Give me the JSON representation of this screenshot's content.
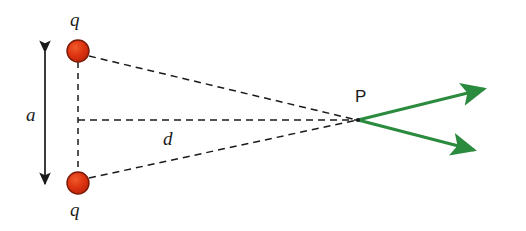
{
  "figure": {
    "background_color": "#ffffff"
  },
  "colors": {
    "charge_fill": "#dd3311",
    "charge_stroke": "#7a1a08",
    "field_arrow": "#2a8a3e",
    "construction_line": "#1a1a1a",
    "dimension_arrow": "#1a1a1a",
    "label_text": "#1a1a1a"
  },
  "labels": {
    "charge_top": "q",
    "charge_bottom": "q",
    "separation": "a",
    "distance": "d",
    "point": "P"
  },
  "charges": [
    {
      "name": "charge-top",
      "label": "q",
      "x": 78,
      "y": 51,
      "radius": 11
    },
    {
      "name": "charge-bottom",
      "label": "q",
      "x": 78,
      "y": 183,
      "radius": 11
    }
  ],
  "point_p": {
    "label": "P",
    "x": 358,
    "y": 120
  },
  "dimension_arrow": {
    "name": "separation-arrow",
    "label": "a",
    "x": 45,
    "y_top": 46,
    "y_bottom": 190,
    "double_headed": true
  },
  "construction_lines": [
    {
      "name": "vertical-axis-line",
      "x1": 78,
      "y1": 51,
      "x2": 78,
      "y2": 183
    },
    {
      "name": "distance-line-d",
      "x1": 78,
      "y1": 120,
      "x2": 358,
      "y2": 120
    },
    {
      "name": "ray-top-charge-to-p",
      "x1": 89,
      "y1": 56,
      "x2": 358,
      "y2": 120
    },
    {
      "name": "ray-bottom-charge-to-p",
      "x1": 89,
      "y1": 178,
      "x2": 358,
      "y2": 120
    }
  ],
  "field_arrows": [
    {
      "name": "field-arrow-upper",
      "x1": 358,
      "y1": 120,
      "x2": 490,
      "y2": 88
    },
    {
      "name": "field-arrow-lower",
      "x1": 358,
      "y1": 120,
      "x2": 480,
      "y2": 152
    }
  ]
}
